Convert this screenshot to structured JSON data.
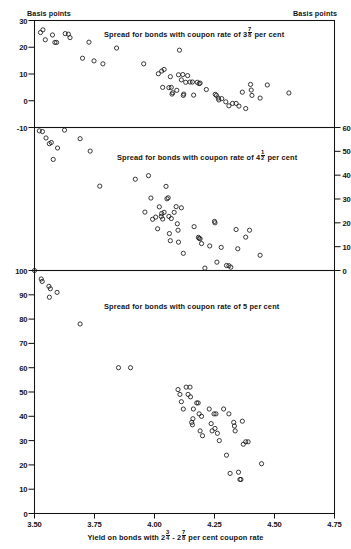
{
  "figure": {
    "corner_label_left": "Basis points",
    "corner_label_right": "Basis points",
    "xlabel_prefix": "Yield on bonds with 2",
    "xlabel_frac1_num": "3",
    "xlabel_frac1_den": "4",
    "xlabel_mid": " - 2",
    "xlabel_frac2_num": "7",
    "xlabel_frac2_den": "8",
    "xlabel_suffix": " per cent coupon rate"
  },
  "chart_data": [
    {
      "type": "scatter",
      "panel": 1,
      "title_prefix": "Spread for bonds with coupon rate of 3",
      "title_frac_num": "7",
      "title_frac_den": "8",
      "title_suffix": " per cent",
      "title": "Spread for bonds with coupon rate of 3 7/8 per cent",
      "xlabel": "Yield on bonds with 2 3/4 - 2 7/8 per cent coupon rate",
      "ylabel": "Basis points",
      "axis_side": "left",
      "xlim": [
        3.5,
        4.75
      ],
      "ylim": [
        -10,
        30
      ],
      "yticks": [
        30,
        20,
        10,
        0,
        -10
      ],
      "ytick_labels": [
        "30",
        "20",
        "10",
        "0",
        "-10"
      ],
      "grid": false,
      "legend": "none",
      "points": [
        [
          3.525,
          25.5
        ],
        [
          3.535,
          26.5
        ],
        [
          3.545,
          22.8
        ],
        [
          3.575,
          24.6
        ],
        [
          3.585,
          21.8
        ],
        [
          3.592,
          21.8
        ],
        [
          3.628,
          25.1
        ],
        [
          3.641,
          24.9
        ],
        [
          3.648,
          23.6
        ],
        [
          3.7,
          15.9
        ],
        [
          3.727,
          21.9
        ],
        [
          3.748,
          14.9
        ],
        [
          3.785,
          13.8
        ],
        [
          3.842,
          19.7
        ],
        [
          3.955,
          13.8
        ],
        [
          4.016,
          10.1
        ],
        [
          4.03,
          11.1
        ],
        [
          4.04,
          11.7
        ],
        [
          4.034,
          5.0
        ],
        [
          4.06,
          4.9
        ],
        [
          4.066,
          9.0
        ],
        [
          4.07,
          5.0
        ],
        [
          4.073,
          2.5
        ],
        [
          4.076,
          3.0
        ],
        [
          4.093,
          3.9
        ],
        [
          4.1,
          9.7
        ],
        [
          4.104,
          18.9
        ],
        [
          4.112,
          7.8
        ],
        [
          4.118,
          9.8
        ],
        [
          4.12,
          2.0
        ],
        [
          4.122,
          2.5
        ],
        [
          4.13,
          6.9
        ],
        [
          4.138,
          9.4
        ],
        [
          4.148,
          7.0
        ],
        [
          4.158,
          7.0
        ],
        [
          4.163,
          2.1
        ],
        [
          4.178,
          6.9
        ],
        [
          4.186,
          6.4
        ],
        [
          4.19,
          6.6
        ],
        [
          4.216,
          4.2
        ],
        [
          4.253,
          2.4
        ],
        [
          4.258,
          2.0
        ],
        [
          4.266,
          1.0
        ],
        [
          4.268,
          0.3
        ],
        [
          4.28,
          0.8
        ],
        [
          4.297,
          -0.4
        ],
        [
          4.31,
          -1.9
        ],
        [
          4.325,
          -1.0
        ],
        [
          4.34,
          -1.0
        ],
        [
          4.352,
          -2.0
        ],
        [
          4.366,
          3.2
        ],
        [
          4.38,
          -2.9
        ],
        [
          4.4,
          6.1
        ],
        [
          4.403,
          4.0
        ],
        [
          4.406,
          2.0
        ],
        [
          4.44,
          1.0
        ],
        [
          4.47,
          5.9
        ],
        [
          4.56,
          2.9
        ]
      ]
    },
    {
      "type": "scatter",
      "panel": 2,
      "title_prefix": "Spread for bonds with coupon rate of 4",
      "title_frac_num": "1",
      "title_frac_den": "2",
      "title_suffix": " per cent",
      "title": "Spread for bonds with coupon rate of 4 1/2 per cent",
      "xlabel": "Yield on bonds with 2 3/4 - 2 7/8 per cent coupon rate",
      "ylabel": "Basis points",
      "axis_side": "right",
      "xlim": [
        3.5,
        4.75
      ],
      "ylim": [
        0,
        60
      ],
      "yticks": [
        60,
        50,
        40,
        30,
        20,
        10,
        0
      ],
      "ytick_labels": [
        "60",
        "50",
        "40",
        "30",
        "20",
        "10",
        "0"
      ],
      "grid": false,
      "legend": "none",
      "points": [
        [
          3.52,
          58.6
        ],
        [
          3.533,
          58.3
        ],
        [
          3.548,
          55.6
        ],
        [
          3.562,
          53.2
        ],
        [
          3.57,
          53.7
        ],
        [
          3.578,
          46.6
        ],
        [
          3.596,
          51.4
        ],
        [
          3.625,
          58.9
        ],
        [
          3.69,
          55.3
        ],
        [
          3.732,
          50.1
        ],
        [
          3.772,
          35.4
        ],
        [
          3.92,
          38.3
        ],
        [
          3.975,
          39.8
        ],
        [
          3.985,
          30.4
        ],
        [
          3.96,
          24.5
        ],
        [
          3.992,
          21.5
        ],
        [
          4.005,
          22.4
        ],
        [
          4.013,
          17.5
        ],
        [
          4.02,
          26.7
        ],
        [
          4.028,
          22.7
        ],
        [
          4.03,
          23.9
        ],
        [
          4.034,
          21.6
        ],
        [
          4.04,
          24.4
        ],
        [
          4.048,
          35.3
        ],
        [
          4.052,
          30.1
        ],
        [
          4.057,
          30.5
        ],
        [
          4.06,
          22.7
        ],
        [
          4.062,
          15.5
        ],
        [
          4.066,
          12.5
        ],
        [
          4.07,
          21.8
        ],
        [
          4.082,
          24.4
        ],
        [
          4.09,
          26.8
        ],
        [
          4.095,
          19.6
        ],
        [
          4.098,
          16.9
        ],
        [
          4.1,
          11.9
        ],
        [
          4.112,
          26.3
        ],
        [
          4.12,
          7.2
        ],
        [
          4.165,
          18.4
        ],
        [
          4.183,
          13.9
        ],
        [
          4.186,
          13.5
        ],
        [
          4.19,
          13.3
        ],
        [
          4.196,
          11.3
        ],
        [
          4.21,
          1.0
        ],
        [
          4.23,
          10.3
        ],
        [
          4.25,
          20.6
        ],
        [
          4.252,
          20.0
        ],
        [
          4.26,
          3.5
        ],
        [
          4.278,
          9.7
        ],
        [
          4.3,
          2.1
        ],
        [
          4.31,
          2.0
        ],
        [
          4.318,
          1.4
        ],
        [
          4.34,
          17.2
        ],
        [
          4.347,
          9.1
        ],
        [
          4.38,
          14.0
        ],
        [
          4.396,
          16.9
        ],
        [
          4.44,
          6.4
        ]
      ]
    },
    {
      "type": "scatter",
      "panel": 3,
      "title": "Spread for bonds with coupon rate of 5 per cent",
      "xlabel": "Yield on bonds with 2 3/4 - 2 7/8 per cent coupon rate",
      "ylabel": "Basis points",
      "axis_side": "left",
      "xlim": [
        3.5,
        4.75
      ],
      "ylim": [
        0,
        100
      ],
      "yticks": [
        100,
        90,
        80,
        70,
        60,
        50,
        40,
        30,
        20,
        10,
        0
      ],
      "ytick_labels": [
        "100",
        "90",
        "80",
        "70",
        "60",
        "50",
        "40",
        "30",
        "20",
        "10",
        "0"
      ],
      "grid": false,
      "legend": "none",
      "points": [
        [
          3.5,
          100.0
        ],
        [
          3.528,
          96.5
        ],
        [
          3.532,
          95.5
        ],
        [
          3.56,
          93.5
        ],
        [
          3.566,
          92.5
        ],
        [
          3.562,
          89.0
        ],
        [
          3.594,
          91.0
        ],
        [
          3.69,
          78.0
        ],
        [
          3.85,
          60.0
        ],
        [
          3.9,
          60.0
        ],
        [
          4.098,
          51.0
        ],
        [
          4.106,
          49.0
        ],
        [
          4.112,
          46.0
        ],
        [
          4.12,
          43.0
        ],
        [
          4.132,
          52.0
        ],
        [
          4.14,
          49.0
        ],
        [
          4.148,
          52.0
        ],
        [
          4.15,
          48.0
        ],
        [
          4.155,
          37.5
        ],
        [
          4.158,
          36.5
        ],
        [
          4.16,
          39.0
        ],
        [
          4.162,
          43.0
        ],
        [
          4.176,
          45.5
        ],
        [
          4.182,
          45.5
        ],
        [
          4.186,
          41.0
        ],
        [
          4.19,
          34.0
        ],
        [
          4.196,
          40.0
        ],
        [
          4.2,
          32.0
        ],
        [
          4.228,
          43.0
        ],
        [
          4.236,
          37.0
        ],
        [
          4.24,
          34.0
        ],
        [
          4.248,
          41.0
        ],
        [
          4.252,
          35.0
        ],
        [
          4.256,
          41.0
        ],
        [
          4.262,
          33.0
        ],
        [
          4.27,
          30.0
        ],
        [
          4.288,
          43.0
        ],
        [
          4.3,
          24.0
        ],
        [
          4.31,
          41.0
        ],
        [
          4.315,
          16.5
        ],
        [
          4.33,
          37.5
        ],
        [
          4.333,
          36.0
        ],
        [
          4.336,
          34.0
        ],
        [
          4.35,
          17.0
        ],
        [
          4.356,
          14.0
        ],
        [
          4.36,
          14.0
        ],
        [
          4.366,
          38.0
        ],
        [
          4.37,
          28.5
        ],
        [
          4.38,
          29.5
        ],
        [
          4.39,
          29.5
        ],
        [
          4.446,
          20.5
        ]
      ]
    }
  ]
}
